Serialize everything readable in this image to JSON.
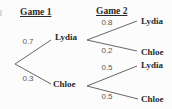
{
  "headers": {
    "game1": "Game 1",
    "game2": "Game 2"
  },
  "tree": {
    "game1": {
      "branches": [
        {
          "probability": "0.7",
          "outcome": "Lydia"
        },
        {
          "probability": "0.3",
          "outcome": "Chloe"
        }
      ]
    },
    "game2": [
      {
        "branches": [
          {
            "probability": "0.8",
            "outcome": "Lydia"
          },
          {
            "probability": "0.2",
            "outcome": "Chloe"
          }
        ]
      },
      {
        "branches": [
          {
            "probability": "0.5",
            "outcome": "Lydia"
          },
          {
            "probability": "0.5",
            "outcome": "Chloe"
          }
        ]
      }
    ]
  },
  "colors": {
    "background": "#fcfcfc",
    "text": "#2a2a2a",
    "numbers": "#595959",
    "lines": "#666666"
  }
}
